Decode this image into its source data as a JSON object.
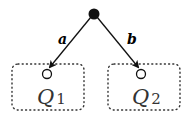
{
  "diagram": {
    "root": {
      "label": "",
      "fill": "#111111"
    },
    "edges": [
      {
        "label": "a",
        "to": "Q1"
      },
      {
        "label": "b",
        "to": "Q2"
      }
    ],
    "states": [
      {
        "name": "Q",
        "subscript": "1"
      },
      {
        "name": "Q",
        "subscript": "2"
      }
    ]
  }
}
